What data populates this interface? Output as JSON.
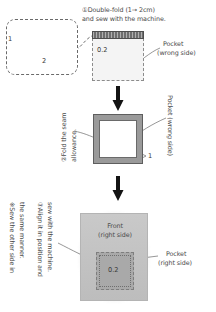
{
  "diagram": {
    "steps": [
      {
        "id": "step-1",
        "number": "①",
        "lines": [
          "①Double-fold (1→ 2cm)",
          "and sew with the machine."
        ],
        "measure": "0.2",
        "part_label_lines": [
          "Pocket",
          "(wrong side)"
        ],
        "detail_labels": [
          "1",
          "2"
        ]
      },
      {
        "id": "step-2",
        "number": "②",
        "lines": [
          "②Fold the seam",
          "allowance."
        ],
        "part_label": "Pocket (wrong side)",
        "edge_label": "1"
      },
      {
        "id": "step-3",
        "number": "③",
        "lines": [
          "③Align it in position and",
          "sew with the machine."
        ],
        "note_lines": [
          "※Sew the other side in",
          "the same manner."
        ],
        "front_label_lines": [
          "Front",
          "(right side)"
        ],
        "part_label_lines": [
          "Pocket",
          "(right side)"
        ],
        "measure": "0.2"
      }
    ],
    "arrows": [
      {
        "name": "flow-arrow-1",
        "glyph": "↓"
      },
      {
        "name": "flow-arrow-2",
        "glyph": "↓"
      }
    ],
    "colors": {
      "ink": "#4a4a4a",
      "stitch_band": "#6e6e6e",
      "fabric_gray": "#c2c2c2",
      "pocket_gray": "#a9a9a9",
      "dash_border": "#8c8c8c",
      "arrow": "#1a1a1a"
    }
  }
}
